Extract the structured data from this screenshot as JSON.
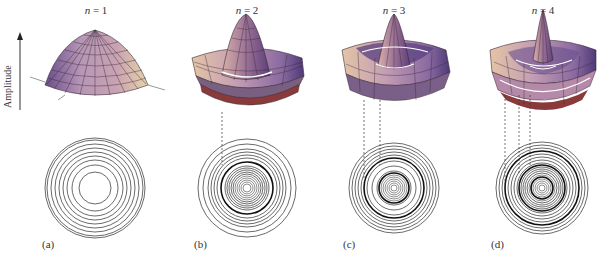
{
  "figure": {
    "axis": {
      "label": "Amplitude",
      "direction": "up"
    },
    "panels": [
      {
        "id": "a",
        "panel_label": "(a)",
        "mode_var": "n",
        "mode_value": "1",
        "mode_text": "n = 1",
        "cx": 95,
        "cy": 188,
        "peak_x": 95,
        "n_rings": 1,
        "ring_radii": [
          16,
          23,
          28,
          32,
          36,
          40,
          44,
          48,
          50
        ],
        "thick_rings": [],
        "inner_dense": false,
        "nodal_dashes": []
      },
      {
        "id": "b",
        "panel_label": "(b)",
        "mode_var": "n",
        "mode_value": "2",
        "mode_text": "n = 2",
        "cx": 247,
        "cy": 188,
        "peak_x": 246,
        "n_rings": 2,
        "ring_radii": [
          4,
          6,
          8,
          10,
          12,
          14,
          16,
          18,
          20,
          22,
          26,
          30,
          33,
          36,
          39,
          44,
          49
        ],
        "thick_rings": [
          26
        ],
        "inner_dense": true,
        "nodal_dashes": [
          {
            "x": 222,
            "y1": 112,
            "y2": 165
          }
        ]
      },
      {
        "id": "c",
        "panel_label": "(c)",
        "mode_var": "n",
        "mode_value": "3",
        "mode_text": "n = 3",
        "cx": 394,
        "cy": 188,
        "peak_x": 394,
        "n_rings": 3,
        "ring_radii": [
          3,
          5,
          7,
          9,
          11,
          13,
          15,
          17,
          22,
          27,
          30,
          33,
          36,
          39,
          42,
          45
        ],
        "thick_rings": [
          15,
          30
        ],
        "inner_dense": true,
        "nodal_dashes": [
          {
            "x": 364,
            "y1": 100,
            "y2": 180
          },
          {
            "x": 380,
            "y1": 100,
            "y2": 165
          }
        ]
      },
      {
        "id": "d",
        "panel_label": "(d)",
        "mode_var": "n",
        "mode_value": "4",
        "mode_text": "n = 4",
        "cx": 542,
        "cy": 188,
        "peak_x": 543,
        "n_rings": 4,
        "ring_radii": [
          3,
          5,
          7,
          9,
          11,
          13,
          15,
          17,
          19,
          21,
          23,
          25,
          28,
          31,
          34,
          37,
          40,
          43,
          46
        ],
        "thick_rings": [
          11,
          23,
          37
        ],
        "inner_dense": true,
        "nodal_dashes": [
          {
            "x": 505,
            "y1": 95,
            "y2": 185
          },
          {
            "x": 519,
            "y1": 95,
            "y2": 175
          },
          {
            "x": 530,
            "y1": 95,
            "y2": 165
          }
        ]
      }
    ],
    "colors": {
      "surface_light": "#e8c9b6",
      "surface_mid": "#b08aa8",
      "surface_dark": "#5c3f7a",
      "surface_shadow": "#3a2a55",
      "rim_red": "#a0302c",
      "grid_line": "#3a2838",
      "node_line": "#ffffff",
      "ring_line": "#444444",
      "label_text": "#333333"
    }
  }
}
